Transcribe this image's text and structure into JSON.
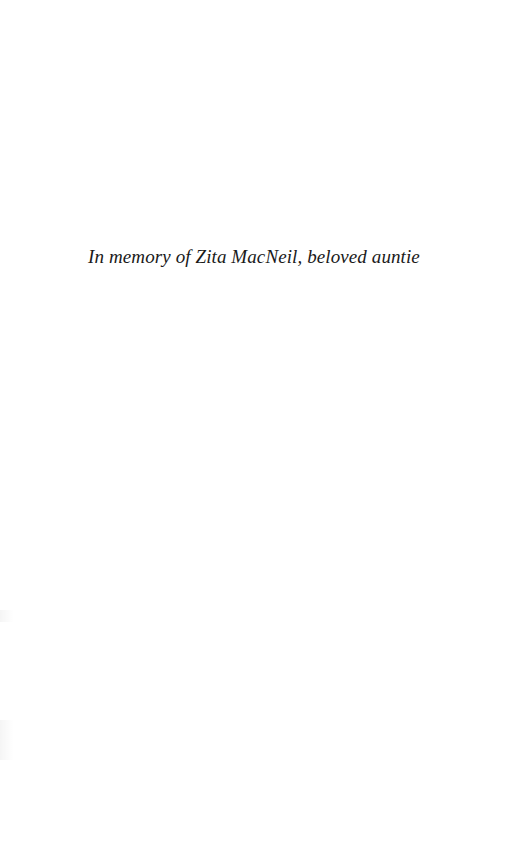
{
  "page": {
    "type": "dedication",
    "dedication_text": "In memory of Zita MacNeil, beloved auntie"
  }
}
